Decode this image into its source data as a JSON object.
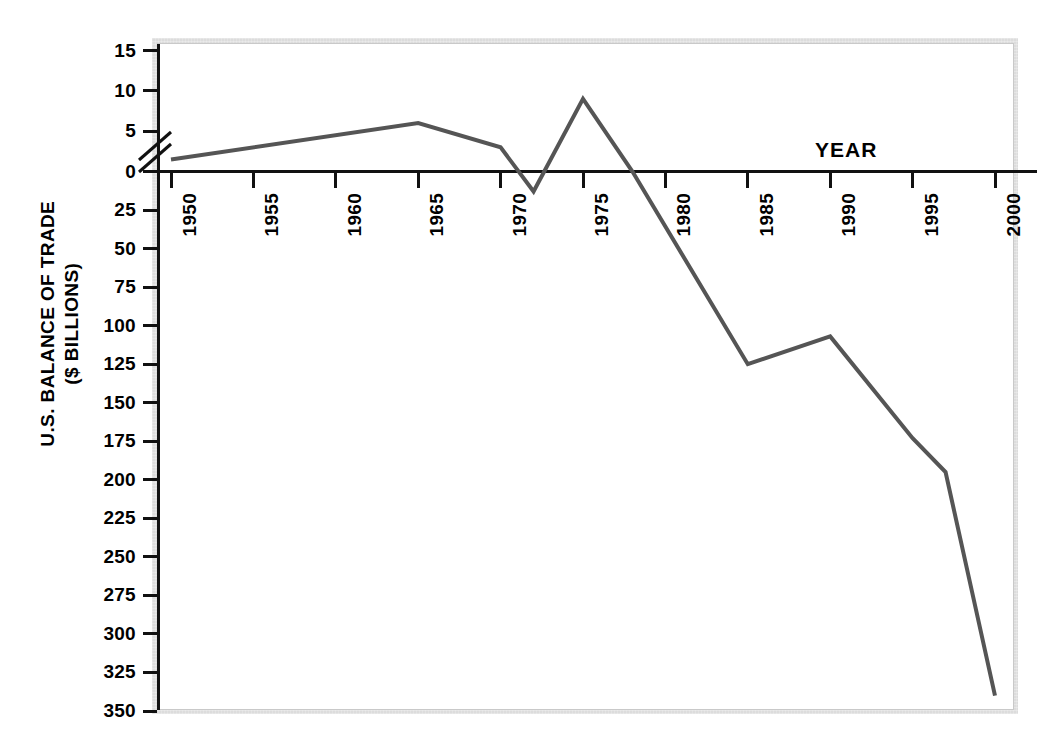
{
  "chart_data": {
    "type": "line",
    "title": "",
    "xlabel": "YEAR",
    "ylabel": "U.S. BALANCE OF TRADE ($ BILLIONS)",
    "ylabel_line1": "U.S. BALANCE OF TRADE",
    "ylabel_line2": "($ BILLIONS)",
    "x_tick_labels": [
      "1950",
      "1955",
      "1960",
      "1965",
      "1970",
      "1975",
      "1980",
      "1985",
      "1990",
      "1995",
      "2000"
    ],
    "x_tick_values": [
      1950,
      1955,
      1960,
      1965,
      1970,
      1975,
      1980,
      1985,
      1990,
      1995,
      2000
    ],
    "y_tick_labels_upper": [
      "15",
      "10",
      "5",
      "0"
    ],
    "y_tick_values_upper": [
      15,
      10,
      5,
      0
    ],
    "y_tick_labels_lower": [
      "25",
      "50",
      "75",
      "100",
      "125",
      "150",
      "175",
      "200",
      "225",
      "250",
      "275",
      "300",
      "325",
      "350"
    ],
    "y_tick_values_lower": [
      -25,
      -50,
      -75,
      -100,
      -125,
      -150,
      -175,
      -200,
      -225,
      -250,
      -275,
      -300,
      -325,
      -350
    ],
    "axis_break": "broken y-axis between 5 and 0; upper segment 0 to 15 at expanded scale, lower segment 0 to -350 compressed",
    "xlim": [
      1950,
      2000
    ],
    "ylim": [
      -350,
      15
    ],
    "grid": false,
    "legend": null,
    "series": [
      {
        "name": "U.S. Balance of Trade",
        "color": "#555555",
        "x": [
          1950,
          1965,
          1970,
          1972,
          1975,
          1978,
          1985,
          1990,
          1995,
          1997,
          2000
        ],
        "values": [
          1.5,
          6,
          3,
          -13,
          9,
          0,
          -125,
          -107,
          -173,
          -195,
          -340
        ]
      }
    ],
    "annotations": [
      {
        "text": "YEAR",
        "x": 1990,
        "y": 0,
        "position": "above-axis"
      }
    ]
  }
}
